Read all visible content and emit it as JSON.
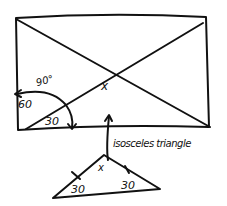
{
  "diagram": {
    "rectangle_labels": {
      "angle_90": "90°",
      "angle_60": "60",
      "angle_30": "30",
      "center_angle": "x"
    },
    "annotation": "isosceles triangle",
    "triangle_labels": {
      "apex": "x",
      "base_left": "30",
      "base_right": "30"
    },
    "stroke_color": "#111111",
    "background": "#ffffff"
  }
}
